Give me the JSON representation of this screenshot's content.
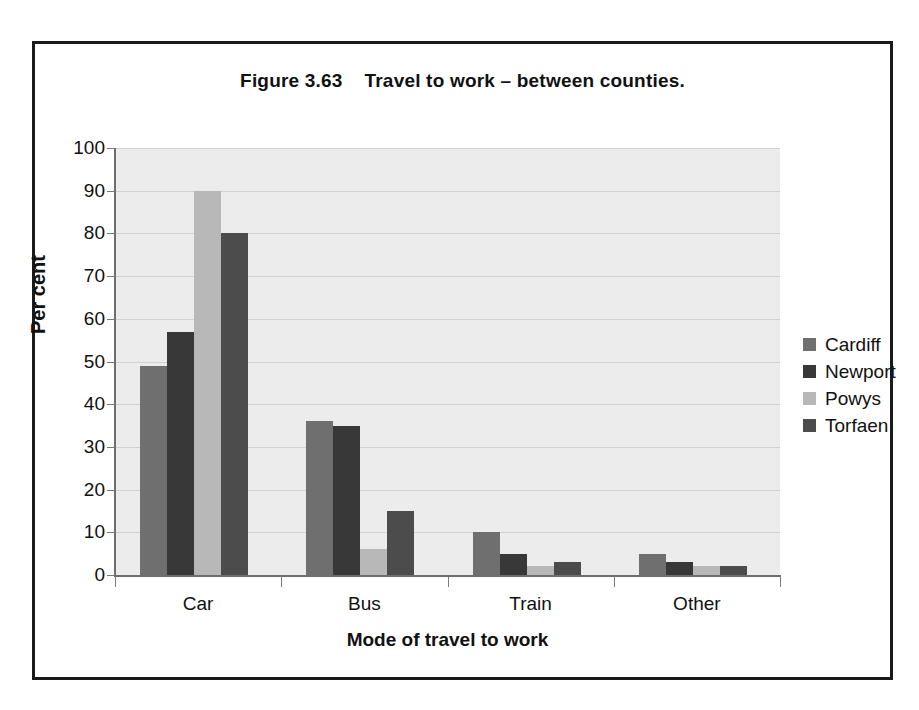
{
  "figure": {
    "title": "Figure 3.63    Travel to work – between counties."
  },
  "chart_data": {
    "type": "bar",
    "title": "Figure 3.63    Travel to work – between counties.",
    "xlabel": "Mode of travel to work",
    "ylabel": "Per cent",
    "ylim": [
      0,
      100
    ],
    "ytick_step": 10,
    "yticks": [
      100,
      90,
      80,
      70,
      60,
      50,
      40,
      30,
      20,
      10,
      0
    ],
    "grid": true,
    "legend_position": "right",
    "categories": [
      "Car",
      "Bus",
      "Train",
      "Other"
    ],
    "series": [
      {
        "name": "Cardiff",
        "color": "#6f6f6f",
        "values": [
          49,
          36,
          10,
          5
        ]
      },
      {
        "name": "Newport",
        "color": "#383838",
        "values": [
          57,
          35,
          5,
          3
        ]
      },
      {
        "name": "Powys",
        "color": "#b8b8b8",
        "values": [
          90,
          6,
          2,
          2
        ]
      },
      {
        "name": "Torfaen",
        "color": "#4c4c4c",
        "values": [
          80,
          15,
          3,
          2
        ]
      }
    ],
    "plot_background": "#ececec",
    "gridline_color": "#d2d2d2",
    "axis_color": "#6e6e6e"
  }
}
